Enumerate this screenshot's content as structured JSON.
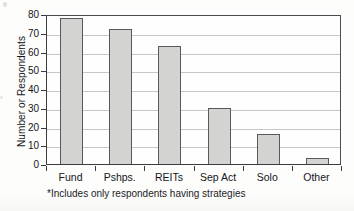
{
  "chart_data": {
    "type": "bar",
    "title": "",
    "xlabel": "",
    "ylabel": "Number or Respondents",
    "categories": [
      "Fund",
      "Pshps.",
      "REITs",
      "Sep Act",
      "Solo",
      "Other"
    ],
    "values": [
      78,
      72,
      63,
      30,
      16,
      3
    ],
    "ylim": [
      0,
      80
    ],
    "ytick_labels": [
      "0",
      "10",
      "20",
      "30",
      "40",
      "50",
      "60",
      "70",
      "80"
    ],
    "ytick_values": [
      0,
      10,
      20,
      30,
      40,
      50,
      60,
      70,
      80
    ],
    "grid": true,
    "legend": null,
    "annotations": [
      "*Includes only respondents having strategies"
    ],
    "colors": {
      "bar_fill": "#d3d3d1",
      "bar_stroke": "#58595b",
      "gridline": "#c6c7c6",
      "axis": "#3a3c3f",
      "text": "#15161a",
      "background": "#fdfdfc"
    }
  },
  "footnote": "*Includes only respondents having strategies"
}
